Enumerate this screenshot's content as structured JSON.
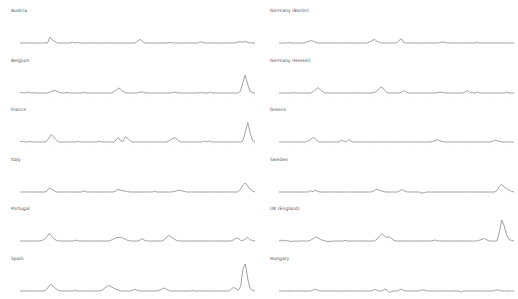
{
  "chart_data": [
    {
      "type": "line",
      "title": "Austria",
      "ylim": [
        0,
        10
      ],
      "values": [
        1,
        1,
        1,
        1,
        1,
        1,
        1,
        1,
        1,
        1,
        1,
        1,
        3,
        2,
        1.5,
        1,
        1,
        1,
        1,
        1,
        1,
        1.3,
        1,
        1.2,
        1,
        1,
        1,
        1,
        1,
        1,
        1,
        1,
        1,
        1,
        1,
        1,
        1,
        1,
        1,
        1,
        1,
        1,
        1,
        1,
        1,
        1,
        1,
        1.6,
        2.2,
        1.5,
        1,
        1,
        1,
        1,
        1,
        1,
        1,
        1,
        1,
        1,
        1.2,
        1,
        1,
        1,
        1,
        1,
        1,
        1,
        1,
        1,
        1,
        1,
        1.4,
        1.2,
        1,
        1,
        1,
        1,
        1,
        1,
        1,
        1,
        1,
        1,
        1,
        1,
        1,
        1.3,
        1.4,
        1.3,
        1.5,
        1.2,
        1,
        1,
        1
      ]
    },
    {
      "type": "line",
      "title": "Germany (Berlin)",
      "ylim": [
        0,
        10
      ],
      "values": [
        1,
        1,
        1,
        1,
        1.2,
        1,
        1,
        1,
        1,
        1,
        1,
        1.3,
        1.5,
        1.8,
        1.6,
        1.2,
        1,
        1,
        1,
        1,
        1,
        1,
        1,
        1,
        1,
        1,
        1,
        1,
        1,
        1,
        1,
        1,
        1,
        1,
        1,
        1,
        1,
        1.3,
        1.8,
        2.2,
        1.6,
        1.2,
        1,
        1,
        1,
        1,
        1,
        1,
        1,
        1.8,
        2.4,
        1.2,
        1,
        1,
        1,
        1,
        1,
        1,
        1,
        1,
        1,
        1,
        1,
        1,
        1,
        1,
        1.2,
        1.3,
        1.2,
        1,
        1,
        1,
        1,
        1,
        1,
        1,
        1,
        1,
        1,
        1,
        1,
        1.3,
        1,
        1,
        1,
        1,
        1,
        1,
        1,
        1,
        1,
        1,
        1,
        1,
        1,
        1,
        1
      ]
    },
    {
      "type": "line",
      "title": "Belgium",
      "ylim": [
        0,
        10
      ],
      "values": [
        1,
        1.2,
        1,
        1.3,
        1,
        1.1,
        1,
        1,
        1,
        1,
        1,
        1,
        1.3,
        1.6,
        1.9,
        1.5,
        1.2,
        1,
        1,
        1.2,
        1,
        1,
        1,
        1,
        1,
        1,
        1.2,
        1,
        1,
        1,
        1,
        1,
        1,
        1,
        1,
        1,
        1,
        1,
        1.5,
        2.1,
        2.7,
        1.9,
        1.3,
        1,
        1,
        1,
        1,
        1,
        1.2,
        1.4,
        1.2,
        1,
        1,
        1,
        1,
        1,
        1,
        1,
        1,
        1,
        1,
        1,
        1.3,
        1.2,
        1,
        1,
        1,
        1,
        1,
        1,
        1,
        1,
        1,
        1.2,
        1,
        1,
        1,
        1.3,
        1,
        1,
        1,
        1,
        1,
        1,
        1,
        1,
        1,
        1,
        1,
        1.5,
        4,
        7,
        4,
        1.5,
        1.2,
        1
      ]
    },
    {
      "type": "line",
      "title": "Germany (Hessel)",
      "ylim": [
        0,
        10
      ],
      "values": [
        1,
        1,
        1,
        1,
        1,
        1,
        1.1,
        1,
        1,
        1,
        1,
        1,
        1,
        1,
        1.5,
        2.2,
        2.8,
        2,
        1.3,
        1,
        1,
        1,
        1,
        1,
        1,
        1,
        1,
        1,
        1,
        1,
        1,
        1,
        1,
        1,
        1,
        1,
        1,
        1,
        1,
        1.2,
        1.6,
        2.6,
        3.0,
        2,
        1.2,
        1,
        1,
        1,
        1,
        1,
        1.3,
        1.8,
        1.3,
        1,
        1,
        1,
        1,
        1,
        1,
        1,
        1,
        1,
        1,
        1,
        1,
        1.2,
        1.3,
        1.2,
        1,
        1,
        1,
        1,
        1,
        1,
        1,
        1,
        1.3,
        1.8,
        1.2,
        1.1,
        1,
        1.3,
        1,
        1,
        1,
        1,
        1,
        1,
        1,
        1,
        1,
        1,
        1,
        1.3,
        1,
        1,
        1
      ]
    },
    {
      "type": "line",
      "title": "France",
      "ylim": [
        0,
        10
      ],
      "values": [
        1,
        1.3,
        1,
        1,
        1.2,
        1,
        1,
        1,
        1,
        1,
        1,
        1.2,
        2.2,
        3.5,
        2.7,
        1.8,
        1,
        1,
        1,
        1,
        1,
        1,
        1,
        1,
        1.2,
        1,
        1,
        1,
        1,
        1,
        1,
        1,
        1,
        1.3,
        1,
        1,
        1,
        1,
        1,
        1,
        1.6,
        2.4,
        1.4,
        1.2,
        2.8,
        2.2,
        1.4,
        1,
        1,
        1,
        1,
        1,
        1,
        1,
        1,
        1,
        1,
        1,
        1,
        1,
        1,
        1,
        1.3,
        1.8,
        2.4,
        2.2,
        1.5,
        1,
        1,
        1,
        1,
        1,
        1,
        1,
        1,
        1,
        1,
        1.3,
        1,
        1.4,
        1,
        1,
        1,
        1,
        1,
        1,
        1,
        1,
        1,
        1,
        1,
        1,
        1,
        1.5,
        4.5,
        7.5,
        4,
        1.5,
        1
      ]
    },
    {
      "type": "line",
      "title": "Greece",
      "ylim": [
        0,
        10
      ],
      "values": [
        1,
        1,
        1,
        1,
        1,
        1,
        1,
        1,
        1,
        1,
        1,
        1,
        1.3,
        1.6,
        2.5,
        2.2,
        1.4,
        1,
        1,
        1,
        1,
        1,
        1,
        1,
        1,
        1,
        1.6,
        1.3,
        1,
        1.8,
        1.3,
        1,
        1,
        1,
        1,
        1,
        1,
        1,
        1,
        1,
        1,
        1,
        1,
        1,
        1,
        1,
        1,
        1,
        1,
        1,
        1,
        1,
        1,
        1,
        1,
        1,
        1,
        1,
        1,
        1,
        1,
        1,
        1,
        1,
        1.2,
        1.4,
        1.8,
        1.4,
        1.2,
        1,
        1,
        1,
        1,
        1,
        1,
        1,
        1,
        1,
        1,
        1,
        1,
        1,
        1,
        1,
        1,
        1,
        1,
        1,
        1,
        1.2,
        1.6,
        1.4,
        1.2,
        1,
        1,
        1,
        1,
        1,
        1
      ]
    },
    {
      "type": "line",
      "title": "Italy",
      "ylim": [
        0,
        10
      ],
      "values": [
        1,
        1,
        1,
        1,
        1,
        1,
        1,
        1,
        1,
        1,
        1,
        1.3,
        2.4,
        1.9,
        1.4,
        1,
        1,
        1,
        1,
        1,
        1,
        1,
        1,
        1,
        1,
        1,
        1.4,
        1,
        1,
        1,
        1,
        1,
        1,
        1,
        1,
        1,
        1,
        1,
        1,
        1.3,
        1.9,
        1.6,
        1.4,
        1.3,
        1.1,
        1,
        1,
        1,
        1,
        1,
        1,
        1,
        1,
        1,
        1,
        1.2,
        1,
        1,
        1,
        1,
        1,
        1,
        1,
        1.2,
        1.4,
        1.6,
        1.4,
        1.2,
        1,
        1,
        1,
        1,
        1,
        1,
        1,
        1,
        1,
        1,
        1,
        1,
        1,
        1,
        1,
        1,
        1,
        1,
        1,
        1,
        1,
        1,
        1.8,
        3.2,
        4,
        3,
        2,
        1.3,
        1
      ]
    },
    {
      "type": "line",
      "title": "Sweden",
      "ylim": [
        0,
        10
      ],
      "values": [
        1,
        1,
        1,
        1,
        1,
        1,
        1,
        1,
        1,
        1,
        1,
        1,
        1,
        1.4,
        1.1,
        1.6,
        1.2,
        1,
        1,
        1,
        1,
        1,
        1,
        1,
        1,
        1,
        1,
        1,
        1,
        1,
        1,
        1,
        1,
        1,
        1,
        1,
        1,
        1,
        1,
        1.3,
        1.8,
        1.8,
        1.4,
        1.2,
        1,
        1,
        1,
        1,
        1,
        1,
        1.5,
        1.8,
        1.2,
        1,
        1,
        1,
        1,
        1,
        1,
        0.6,
        0.8,
        1,
        1,
        1,
        1,
        1,
        1,
        1,
        1,
        1,
        1,
        1,
        1,
        1,
        1,
        1,
        1,
        1,
        1,
        1,
        1,
        1,
        1,
        1,
        1,
        1,
        1,
        1,
        1,
        1,
        1.5,
        3,
        3.5,
        2.6,
        2.2,
        1.6,
        1.2,
        1
      ]
    },
    {
      "type": "line",
      "title": "Portugal",
      "ylim": [
        0,
        10
      ],
      "values": [
        1,
        1,
        1,
        1,
        1,
        1,
        1,
        1,
        1,
        1.2,
        1.6,
        2.4,
        3.6,
        2.5,
        1.6,
        1.2,
        1,
        1,
        1,
        1,
        1,
        1,
        1,
        1.3,
        1,
        1,
        1,
        1,
        1,
        1,
        1,
        1,
        1,
        1,
        1,
        1,
        1,
        1.2,
        1.6,
        2.0,
        2.2,
        2.2,
        2,
        1.6,
        1.2,
        1,
        1,
        1,
        1,
        1.3,
        1.8,
        1.2,
        1,
        1,
        1,
        1,
        1,
        1,
        1,
        1.4,
        2.4,
        2.8,
        2.2,
        1.6,
        1.2,
        1,
        1,
        1,
        1,
        1,
        1,
        1,
        1,
        1,
        1,
        1,
        1,
        1,
        1,
        1,
        1,
        1,
        1,
        1,
        1,
        1,
        1,
        1.3,
        1.8,
        2,
        1.3,
        1.1,
        1.6,
        2.2,
        1.4,
        1.2,
        1
      ]
    },
    {
      "type": "line",
      "title": "UK (England)",
      "ylim": [
        0,
        10
      ],
      "values": [
        1,
        1.3,
        1,
        1.2,
        1,
        0.8,
        1,
        0.9,
        1,
        1,
        1,
        1,
        1,
        1.3,
        1.8,
        2.4,
        2,
        1.5,
        1.2,
        1,
        0.8,
        0.9,
        1,
        1,
        1,
        1,
        1,
        1.2,
        1,
        1,
        1,
        1,
        1,
        1,
        1,
        1,
        1,
        1,
        1,
        1,
        1.6,
        2.6,
        3.4,
        2.7,
        2.2,
        2.4,
        1.8,
        1.2,
        1,
        1,
        1,
        1,
        1,
        1,
        1,
        1,
        1,
        1,
        1,
        1,
        1,
        1,
        1,
        1.2,
        1.3,
        1,
        1,
        1,
        1,
        1,
        1,
        1,
        1,
        1,
        1,
        1,
        1,
        1,
        1,
        1,
        1,
        1,
        1.3,
        1.6,
        1.8,
        1.3,
        1,
        1,
        1,
        1,
        4,
        8,
        6,
        3,
        1.5,
        1.2,
        1
      ]
    },
    {
      "type": "line",
      "title": "Spain",
      "ylim": [
        0,
        10
      ],
      "values": [
        1,
        1,
        1,
        1,
        1,
        1,
        1,
        1,
        1,
        1,
        1,
        1.4,
        2.6,
        3.2,
        2.5,
        1.7,
        1.2,
        1,
        1,
        1,
        1,
        1,
        1,
        1.3,
        1,
        1,
        1,
        1,
        1,
        1,
        1,
        1,
        1,
        1,
        1.2,
        1.7,
        2.4,
        2.8,
        2.4,
        2,
        1.6,
        1.3,
        1,
        1,
        1,
        1,
        1,
        1.3,
        1.6,
        1.2,
        1,
        1,
        1,
        1,
        1,
        1,
        1,
        1,
        1.2,
        1.6,
        2.0,
        1.6,
        1.2,
        1,
        1,
        1,
        1,
        1,
        1,
        1,
        1,
        1,
        1.2,
        1,
        1,
        1,
        1,
        1,
        1,
        1,
        1,
        1,
        1,
        1,
        1,
        1,
        1,
        1,
        1.5,
        2.2,
        1.8,
        1.2,
        2.5,
        8.5,
        10,
        5,
        1.8,
        1.2,
        1
      ]
    },
    {
      "type": "line",
      "title": "Hungary",
      "ylim": [
        0,
        10
      ],
      "values": [
        1,
        1,
        1,
        1,
        1,
        1,
        1,
        1,
        1,
        1,
        1,
        1,
        1,
        1,
        1.2,
        1.6,
        1.3,
        1,
        1,
        1,
        1,
        1,
        1,
        1,
        1,
        1,
        1,
        1,
        1,
        1,
        1,
        1,
        1,
        1,
        1,
        1,
        1,
        1,
        1,
        1.2,
        1.5,
        1.2,
        1,
        1,
        1.6,
        1.4,
        0.6,
        0.8,
        1,
        1,
        1.3,
        1.6,
        1.2,
        1,
        1,
        1,
        1,
        1,
        1,
        1.2,
        1.4,
        1.2,
        1,
        1,
        1,
        1,
        1,
        1,
        1,
        1,
        1,
        1,
        1,
        1,
        1,
        1,
        0.7,
        1,
        1,
        1,
        1,
        1,
        1,
        1,
        1,
        1,
        1,
        1,
        1,
        1,
        1.2,
        1.4,
        1.2,
        1,
        1,
        1,
        1,
        1,
        1
      ]
    }
  ],
  "panels": [
    {
      "title": "Austria"
    },
    {
      "title": "Germany (Berlin)"
    },
    {
      "title": "Belgium"
    },
    {
      "title": "Germany (Hessel)"
    },
    {
      "title": "France"
    },
    {
      "title": "Greece"
    },
    {
      "title": "Italy"
    },
    {
      "title": "Sweden"
    },
    {
      "title": "Portugal"
    },
    {
      "title": "UK (England)"
    },
    {
      "title": "Spain"
    },
    {
      "title": "Hungary"
    }
  ],
  "style": {
    "line_color": "#8a8a8a",
    "tick_color": "#e3e3e3",
    "title_color": "#555555"
  }
}
